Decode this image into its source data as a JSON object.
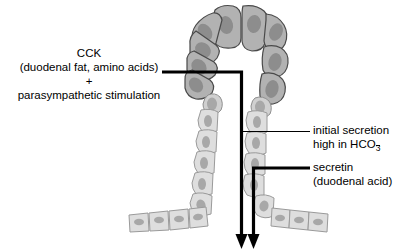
{
  "diagram": {
    "labels": {
      "cck": "CCK",
      "cck_detail": "(duodenal fat, amino acids)",
      "plus": "+",
      "parasympathetic": "parasympathetic stimulation",
      "initial_secretion_line1": "initial secretion",
      "initial_secretion_line2_prefix": "high in HCO",
      "initial_secretion_line2_sub": "3",
      "secretin_line1": "secretin",
      "secretin_line2": "(duodenal acid)"
    },
    "colors": {
      "acinar_fill": "#b2b2b2",
      "acinar_nucleus": "#8d8d8d",
      "acinar_stroke": "#4a4a4a",
      "duct_fill": "#dedede",
      "duct_nucleus": "#a8a8a8",
      "duct_stroke": "#9a9a9a",
      "connector": "#000000",
      "background": "#ffffff"
    },
    "connectors": {
      "cck_label": "cck-connector-line",
      "secretin_label": "secretin-connector-line",
      "initial_secretion_label": "initial-secretion-leader-line"
    },
    "arrows": {
      "left_arrow": "cck-flow-arrow",
      "right_arrow": "secretin-flow-arrow"
    },
    "structures": {
      "acinus": "acinar-cell-arch",
      "duct_left": "duct-wall-left",
      "duct_right": "duct-wall-right",
      "duct_floor_left": "duct-floor-left",
      "duct_floor_right": "duct-floor-right"
    }
  }
}
